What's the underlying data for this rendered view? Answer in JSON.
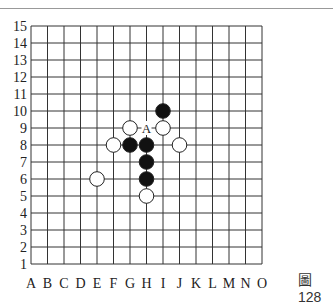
{
  "board": {
    "size": 15,
    "columns": [
      "A",
      "B",
      "C",
      "D",
      "E",
      "F",
      "G",
      "H",
      "I",
      "J",
      "K",
      "L",
      "M",
      "N",
      "O"
    ],
    "rows": [
      "15",
      "14",
      "13",
      "12",
      "11",
      "10",
      "9",
      "8",
      "7",
      "6",
      "5",
      "4",
      "3",
      "2",
      "1"
    ],
    "origin": {
      "x": 31,
      "y": 26
    },
    "cell": {
      "w": 16.5,
      "h": 17
    },
    "line_color": "#333333",
    "stones": [
      {
        "color": "black",
        "pos": "I10"
      },
      {
        "color": "white",
        "pos": "G9"
      },
      {
        "color": "white",
        "pos": "I9"
      },
      {
        "color": "white",
        "pos": "F8"
      },
      {
        "color": "black",
        "pos": "G8"
      },
      {
        "color": "black",
        "pos": "H8"
      },
      {
        "color": "white",
        "pos": "J8"
      },
      {
        "color": "black",
        "pos": "H7"
      },
      {
        "color": "white",
        "pos": "E6"
      },
      {
        "color": "black",
        "pos": "H6"
      },
      {
        "color": "white",
        "pos": "H5"
      }
    ],
    "marks": [
      {
        "label": "A",
        "pos": "H9"
      }
    ]
  },
  "caption": "圖128"
}
